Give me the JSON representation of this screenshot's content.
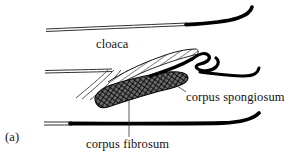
{
  "figure": {
    "panel_label": "(a)",
    "type": "anatomical-line-drawing",
    "labels": [
      {
        "id": "cloaca",
        "text": "cloaca"
      },
      {
        "id": "corpus_spongiosum",
        "text": "corpus spongiosum"
      },
      {
        "id": "corpus_fibrosum",
        "text": "corpus fibrosum"
      }
    ],
    "colors": {
      "ink": "#111111",
      "background": "#ffffff",
      "hatch": "#222222",
      "crosshatch": "#1a1a1a"
    },
    "structures": [
      {
        "id": "dorsal-wall",
        "name": "dorsal cloacal wall",
        "style": "thin-double-line-to-thick-black-curve"
      },
      {
        "id": "middle-wall",
        "name": "middle cloacal wall",
        "style": "thin-double-line"
      },
      {
        "id": "ventral-wall",
        "name": "ventral cloacal wall",
        "style": "thin-double-line-to-thick-black-curve"
      },
      {
        "id": "spongiosum-body",
        "name": "corpus spongiosum",
        "style": "diagonal-hatched-wedge"
      },
      {
        "id": "fibrosum-body",
        "name": "corpus fibrosum",
        "style": "dark-cross-hatched-lobe"
      },
      {
        "id": "sulcus-squiggle",
        "name": "sulcus spermaticus coil",
        "style": "thick-black-double-loop"
      },
      {
        "id": "fold-lines",
        "name": "cloacal folds",
        "style": "three-thin-curved-lines"
      }
    ]
  }
}
